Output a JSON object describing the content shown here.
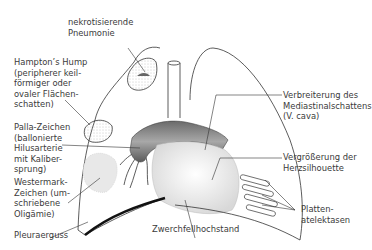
{
  "diagram": {
    "labels": {
      "nekrotisierende": "nekrotisierende\nPneumonie",
      "hampton": "Hampton’s Hump\n(peripherer keil-\nförmiger oder\novaler Flächen-\nschatten)",
      "palla": "Palla-Zeichen\n(ballonierte\nHilusarterie\nmit Kaliber-\nsprung)",
      "westermark": "Westermark-\nZeichen (um-\nschriebene\nOligämie)",
      "pleura": "Pleuraerguss",
      "zwerchfell": "Zwerchfellhochstand",
      "mediastinum": "Verbreiterung des\nMediastinalschattens\n(V. cava)",
      "herz": "Vergrößerung der\nHerzsilhouette",
      "platten": "Platten-\natelektasen"
    },
    "colors": {
      "line": "#333333",
      "vessel_dark": "#555555",
      "vessel_light": "#9a9a9a",
      "heart_fill": "#f2f2f2",
      "stipple": "#bdbdbd",
      "oligemia": "#e6e6e6"
    }
  }
}
